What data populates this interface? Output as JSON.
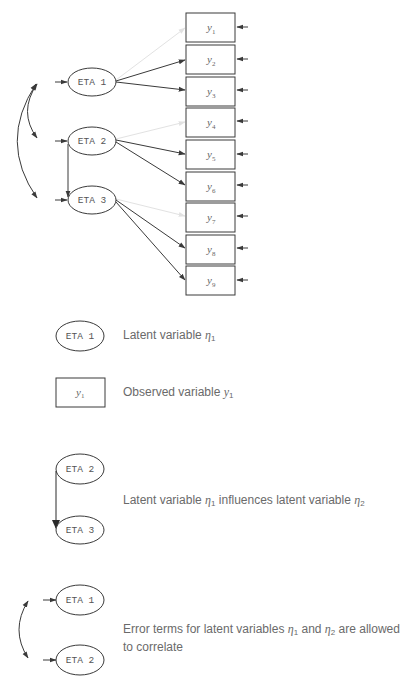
{
  "diagram": {
    "latent_variables": [
      {
        "id": "eta1",
        "label": "ETA 1",
        "cx": 92,
        "cy": 82
      },
      {
        "id": "eta2",
        "label": "ETA 2",
        "cx": 92,
        "cy": 141
      },
      {
        "id": "eta3",
        "label": "ETA 3",
        "cx": 92,
        "cy": 200
      }
    ],
    "observed_variables": [
      {
        "id": "y1",
        "label": "y",
        "sub": "1"
      },
      {
        "id": "y2",
        "label": "y",
        "sub": "2"
      },
      {
        "id": "y3",
        "label": "y",
        "sub": "3"
      },
      {
        "id": "y4",
        "label": "y",
        "sub": "4"
      },
      {
        "id": "y5",
        "label": "y",
        "sub": "5"
      },
      {
        "id": "y6",
        "label": "y",
        "sub": "6"
      },
      {
        "id": "y7",
        "label": "y",
        "sub": "7"
      },
      {
        "id": "y8",
        "label": "y",
        "sub": "8"
      },
      {
        "id": "y9",
        "label": "y",
        "sub": "9"
      }
    ],
    "paths": [
      {
        "from": "eta1",
        "to": "y1",
        "style": "faint"
      },
      {
        "from": "eta1",
        "to": "y2",
        "style": "solid"
      },
      {
        "from": "eta1",
        "to": "y3",
        "style": "solid"
      },
      {
        "from": "eta2",
        "to": "y4",
        "style": "faint"
      },
      {
        "from": "eta2",
        "to": "y5",
        "style": "solid"
      },
      {
        "from": "eta2",
        "to": "y6",
        "style": "solid"
      },
      {
        "from": "eta3",
        "to": "y7",
        "style": "faint"
      },
      {
        "from": "eta3",
        "to": "y8",
        "style": "solid"
      },
      {
        "from": "eta3",
        "to": "y9",
        "style": "solid"
      },
      {
        "from": "eta2",
        "to": "eta3",
        "style": "structural"
      }
    ],
    "correlations": [
      {
        "between": [
          "eta1",
          "eta2"
        ]
      },
      {
        "between": [
          "eta1",
          "eta3"
        ]
      }
    ]
  },
  "legend": {
    "latent": {
      "shape_label": "ETA 1",
      "text": "Latent variable ",
      "symbol": "η",
      "sub": "1"
    },
    "observed": {
      "shape_label": "y",
      "shape_sub": "1",
      "text": "Observed variable ",
      "symbol": "y",
      "sub": "1"
    },
    "influence": {
      "top_label": "ETA 2",
      "bottom_label": "ETA 3",
      "text_a": "Latent variable ",
      "sym_a": "η",
      "sub_a": "1",
      "text_b": " influences latent variable ",
      "sym_b": "η",
      "sub_b": "2"
    },
    "correlation": {
      "top_label": "ETA 1",
      "bottom_label": "ETA 2",
      "text_a": "Error terms for latent variables ",
      "sym_a": "η",
      "sub_a": "1",
      "text_b": " and ",
      "sym_b": "η",
      "sub_b": "2",
      "text_c": " are allowed",
      "line2": "to correlate"
    }
  },
  "colors": {
    "stroke": "#3a3a3a",
    "faint": "#e2e2e2",
    "text": "#6a6a6a"
  }
}
